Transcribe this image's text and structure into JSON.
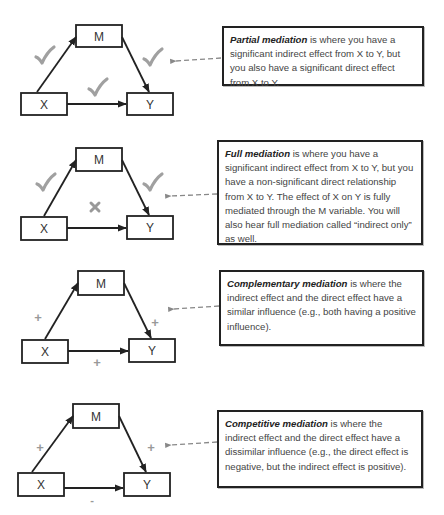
{
  "colors": {
    "box_border": "#222222",
    "arrow": "#222222",
    "mark": "#999999",
    "dashed_arrow": "#888888",
    "text": "#444444"
  },
  "rows": [
    {
      "id": "partial",
      "nodes": {
        "m": "M",
        "x": "X",
        "y": "Y"
      },
      "marks": {
        "x_to_m": "check-icon",
        "m_to_y": "check-icon",
        "x_to_y": "check-icon"
      },
      "description": {
        "term": "Partial mediation",
        "text": " is where you have a significant indirect effect from X to Y, but you also have a significant direct effect from X to Y."
      }
    },
    {
      "id": "full",
      "nodes": {
        "m": "M",
        "x": "X",
        "y": "Y"
      },
      "marks": {
        "x_to_m": "check-icon",
        "m_to_y": "check-icon",
        "x_to_y": "x-icon"
      },
      "description": {
        "term": "Full mediation",
        "text": " is where you have a significant indirect effect from X to Y, but you have a non-significant direct relationship from X to Y. The effect of X on Y is fully mediated through the M variable. You will also hear full mediation called “indirect only” as well."
      }
    },
    {
      "id": "complementary",
      "nodes": {
        "m": "M",
        "x": "X",
        "y": "Y"
      },
      "marks": {
        "x_to_m": "+",
        "m_to_y": "+",
        "x_to_y": "+"
      },
      "description": {
        "term": "Complementary mediation",
        "text": " is where the indirect effect and the direct effect have a similar influence (e.g., both having a positive influence)."
      }
    },
    {
      "id": "competitive",
      "nodes": {
        "m": "M",
        "x": "X",
        "y": "Y"
      },
      "marks": {
        "x_to_m": "+",
        "m_to_y": "+",
        "x_to_y": "-"
      },
      "description": {
        "term": "Competitive mediation",
        "text": " is where the indirect effect and the direct effect have a dissimilar influence (e.g., the direct effect is negative, but the indirect effect is positive)."
      }
    }
  ]
}
